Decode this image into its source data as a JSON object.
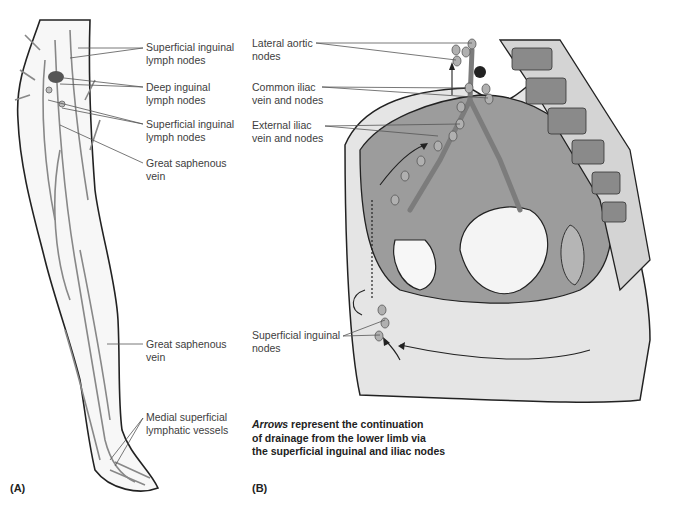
{
  "figure": {
    "panel_a": {
      "tag": "(A)",
      "labels": [
        {
          "id": "superficial-inguinal-upper",
          "text": "Superficial inguinal\nlymph nodes"
        },
        {
          "id": "deep-inguinal",
          "text": "Deep inguinal\nlymph nodes"
        },
        {
          "id": "superficial-inguinal-lower",
          "text": "Superficial inguinal\nlymph nodes"
        },
        {
          "id": "great-saphenous-upper",
          "text": "Great saphenous\nvein"
        },
        {
          "id": "great-saphenous-lower",
          "text": "Great saphenous\nvein"
        },
        {
          "id": "medial-superficial",
          "text": "Medial superficial\nlymphatic vessels"
        }
      ]
    },
    "panel_b": {
      "tag": "(B)",
      "labels": [
        {
          "id": "lateral-aortic",
          "text": "Lateral aortic\nnodes"
        },
        {
          "id": "common-iliac",
          "text": "Common iliac\nvein and nodes"
        },
        {
          "id": "external-iliac",
          "text": "External iliac\nvein and nodes"
        },
        {
          "id": "superficial-inguinal",
          "text": "Superficial inguinal\nnodes"
        }
      ],
      "caption": {
        "emphasis": "Arrows",
        "rest_line1": " represent the continuation",
        "line2": "of drainage from the lower limb via",
        "line3": "the superficial inguinal and iliac nodes"
      }
    }
  }
}
